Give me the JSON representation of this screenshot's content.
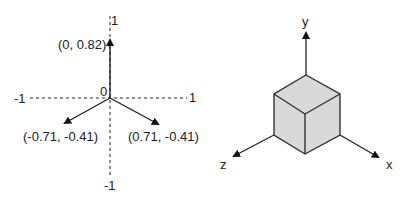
{
  "left_diagram": {
    "axis_labels": {
      "top": "1",
      "bottom": "-1",
      "left": "-1",
      "right": "1",
      "origin": "0"
    },
    "vectors": [
      {
        "label": "(0, 0.82)",
        "x": 0,
        "y": 0.82
      },
      {
        "label": "(-0.71, -0.41)",
        "x": -0.71,
        "y": -0.41
      },
      {
        "label": "(0.71, -0.41)",
        "x": 0.71,
        "y": -0.41
      }
    ]
  },
  "right_diagram": {
    "axes": {
      "x": "x",
      "y": "y",
      "z": "z"
    },
    "shape": "cube",
    "fill_color": "#d8d8d8",
    "stroke_color": "#333333"
  }
}
